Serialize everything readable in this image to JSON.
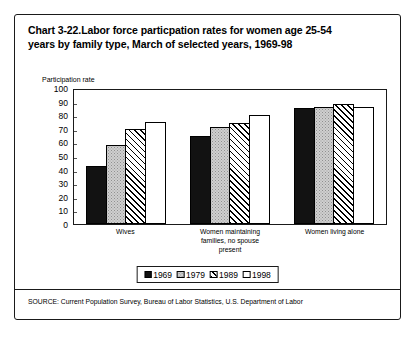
{
  "chart_data": {
    "type": "bar",
    "title": "Chart 3-22.Labor force particpation rates for women age 25-54 years by family type, March of selected years, 1969-98",
    "title_line1": "Chart 3-22.Labor force particpation rates for women age 25-54",
    "title_line2": "years by family type, March of selected years, 1969-98",
    "xlabel": "",
    "ylabel": "Participation rate",
    "ylim": [
      0,
      100
    ],
    "ytick_labels": [
      "100",
      "90",
      "80",
      "70",
      "60",
      "50",
      "40",
      "30",
      "20",
      "10",
      "0"
    ],
    "ytick_values": [
      100,
      90,
      80,
      70,
      60,
      50,
      40,
      30,
      20,
      10,
      0
    ],
    "grid": false,
    "legend_position": "bottom",
    "categories": [
      "Wives",
      "Women maintaining families, no spouse present",
      "Women living alone"
    ],
    "category_label_lines": [
      [
        "Wives"
      ],
      [
        "Women maintaining",
        "families, no spouse",
        "present"
      ],
      [
        "Women living alone"
      ]
    ],
    "series": [
      {
        "name": "1969",
        "fill": "solid-black",
        "values": [
          43,
          65,
          85
        ]
      },
      {
        "name": "1979",
        "fill": "gray-stipple",
        "values": [
          58,
          71,
          86
        ]
      },
      {
        "name": "1989",
        "fill": "diagonal-hatch",
        "values": [
          70,
          74,
          88
        ]
      },
      {
        "name": "1998",
        "fill": "white",
        "values": [
          75,
          80,
          86
        ]
      }
    ],
    "source": "SOURCE: Current Population Survey, Bureau of Labor Statistics, U.S. Department of Labor"
  },
  "colors": {
    "ink": "#000000",
    "frame": "#1a1a1a",
    "series_1969": "#121212",
    "series_1979": "#cfcfcf",
    "series_1989": "#ffffff",
    "series_1998": "#ffffff",
    "background": "#ffffff"
  }
}
